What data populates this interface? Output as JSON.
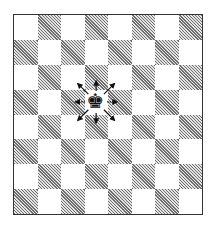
{
  "diagram": {
    "title": "",
    "board": {
      "files": 8,
      "ranks": 8,
      "top_left_color": "light",
      "light_color": "#ffffff",
      "dark_color": "hatched-gray"
    },
    "piece": {
      "name": "king",
      "color": "black",
      "glyph": "♚",
      "row": 3,
      "col": 3
    },
    "moves": [
      {
        "dir": "up"
      },
      {
        "dir": "down"
      },
      {
        "dir": "left"
      },
      {
        "dir": "right"
      },
      {
        "dir": "up-left"
      },
      {
        "dir": "up-right"
      },
      {
        "dir": "down-left"
      },
      {
        "dir": "down-right"
      }
    ]
  }
}
